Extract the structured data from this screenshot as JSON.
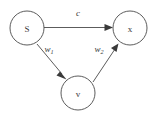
{
  "diagram": {
    "type": "directed-graph",
    "background_color": "#ffffff",
    "stroke_color": "#4a4a4a",
    "text_color": "#3a3a3a",
    "nodes": [
      {
        "id": "S",
        "label": "S",
        "cx": 27,
        "cy": 28,
        "r": 17
      },
      {
        "id": "x",
        "label": "x",
        "cx": 130,
        "cy": 28,
        "r": 17
      },
      {
        "id": "v",
        "label": "v",
        "cx": 78,
        "cy": 93,
        "r": 17
      }
    ],
    "edges": [
      {
        "id": "S-x",
        "from": "S",
        "to": "x",
        "label": "c",
        "label_sub": "",
        "label_x": 78,
        "label_y": 13
      },
      {
        "id": "S-v",
        "from": "S",
        "to": "v",
        "label": "w",
        "label_sub": "1",
        "label_x": 49,
        "label_y": 49
      },
      {
        "id": "v-x",
        "from": "v",
        "to": "x",
        "label": "w",
        "label_sub": "2",
        "label_x": 99,
        "label_y": 49
      }
    ]
  }
}
